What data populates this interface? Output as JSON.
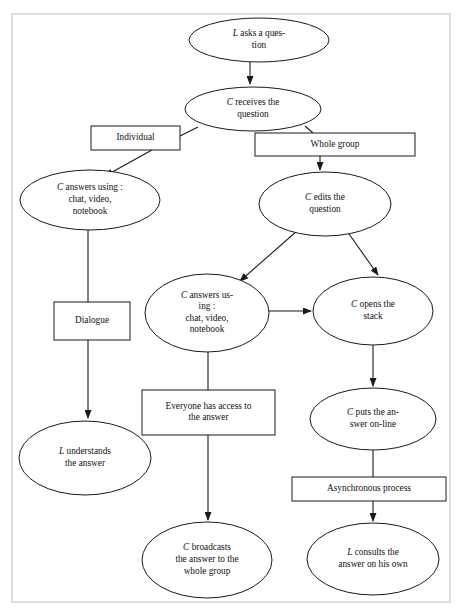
{
  "diagram": {
    "frame": {
      "x": 12,
      "y": 14,
      "width": 438,
      "height": 588,
      "color": "#c8c8c8"
    },
    "stroke_color": "#1a1a1a",
    "fill_color": "#ffffff",
    "nodes": [
      {
        "id": "l-asks-question",
        "shape": "ellipse",
        "cx": 259,
        "cy": 40,
        "rx": 70,
        "ry": 22,
        "lines": [
          "L asks a ques-",
          "tion"
        ],
        "actor": "L"
      },
      {
        "id": "c-receives-question",
        "shape": "ellipse",
        "cx": 253,
        "cy": 109,
        "rx": 68,
        "ry": 22,
        "lines": [
          "C  receives the",
          "question"
        ],
        "actor": "C"
      },
      {
        "id": "individual",
        "shape": "rect",
        "x": 91,
        "y": 126,
        "width": 89,
        "height": 24,
        "lines": [
          "Individual"
        ]
      },
      {
        "id": "whole-group",
        "shape": "rect",
        "x": 255,
        "y": 133,
        "width": 160,
        "height": 23,
        "lines": [
          "Whole group"
        ]
      },
      {
        "id": "c-answers-individual",
        "shape": "ellipse",
        "cx": 90,
        "cy": 200,
        "rx": 70,
        "ry": 30,
        "lines": [
          "C answers using :",
          "chat, video,",
          "notebook"
        ],
        "actor": "C"
      },
      {
        "id": "c-edits-question",
        "shape": "ellipse",
        "cx": 325,
        "cy": 204,
        "rx": 66,
        "ry": 32,
        "lines": [
          "C edits the",
          "question"
        ],
        "actor": "C"
      },
      {
        "id": "c-answers-group",
        "shape": "ellipse",
        "cx": 207,
        "cy": 313,
        "rx": 62,
        "ry": 39,
        "lines": [
          "C answers us-",
          "ing :",
          "chat, video,",
          "notebook"
        ],
        "actor": "C"
      },
      {
        "id": "c-opens-stack",
        "shape": "ellipse",
        "cx": 373,
        "cy": 311,
        "rx": 60,
        "ry": 34,
        "lines": [
          "C  opens the",
          "stack"
        ],
        "actor": "C"
      },
      {
        "id": "dialogue",
        "shape": "rect",
        "x": 54,
        "y": 302,
        "width": 76,
        "height": 38,
        "lines": [
          "Dialogue"
        ]
      },
      {
        "id": "everyone-access",
        "shape": "rect",
        "x": 142,
        "y": 390,
        "width": 133,
        "height": 45,
        "lines": [
          "Everyone has access to",
          "the answer"
        ]
      },
      {
        "id": "c-puts-answer-online",
        "shape": "ellipse",
        "cx": 373,
        "cy": 419,
        "rx": 63,
        "ry": 31,
        "lines": [
          "C  puts the an-",
          "swer on-line"
        ],
        "actor": "C"
      },
      {
        "id": "l-understands-answer",
        "shape": "ellipse",
        "cx": 85,
        "cy": 458,
        "rx": 66,
        "ry": 37,
        "lines": [
          "L understands",
          "the answer"
        ],
        "actor": "L"
      },
      {
        "id": "asynchronous-process",
        "shape": "rect",
        "x": 292,
        "y": 477,
        "width": 154,
        "height": 24,
        "lines": [
          "Asynchronous process"
        ]
      },
      {
        "id": "c-broadcasts",
        "shape": "ellipse",
        "cx": 207,
        "cy": 560,
        "rx": 65,
        "ry": 38,
        "lines": [
          "C  broadcasts",
          "the answer to the",
          "whole group"
        ],
        "actor": "C"
      },
      {
        "id": "l-consults-answer",
        "shape": "ellipse",
        "cx": 373,
        "cy": 559,
        "rx": 66,
        "ry": 36,
        "lines": [
          "L consults the",
          "answer on his own"
        ],
        "actor": "L"
      }
    ],
    "edges": [
      {
        "id": "e1",
        "from": "l-asks-question",
        "to": "c-receives-question",
        "path": "M 250 62 L 250 84",
        "arrow": true
      },
      {
        "id": "e2",
        "from": "c-receives-question",
        "to": "individual",
        "path": "M 198 127 L 180 136",
        "arrow": false
      },
      {
        "id": "e3",
        "from": "c-receives-question",
        "to": "whole-group",
        "path": "M 305 126 L 313 133",
        "arrow": false
      },
      {
        "id": "e4",
        "from": "individual",
        "to": "c-answers-individual",
        "path": "M 152 150 L 105 176",
        "arrow": true
      },
      {
        "id": "e5",
        "from": "whole-group",
        "to": "c-edits-question",
        "path": "M 320 156 L 320 170",
        "arrow": true
      },
      {
        "id": "e6",
        "from": "c-edits-question",
        "to": "c-answers-group",
        "path": "M 297 231 L 240 281",
        "arrow": true
      },
      {
        "id": "e7",
        "from": "c-edits-question",
        "to": "c-opens-stack",
        "path": "M 347 231 L 378 275",
        "arrow": true
      },
      {
        "id": "e8",
        "from": "c-answers-group",
        "to": "c-opens-stack",
        "path": "M 268 311 L 311 311",
        "arrow": true
      },
      {
        "id": "e9",
        "from": "c-answers-individual",
        "to": "dialogue",
        "path": "M 88 230 L 88 302",
        "arrow": false
      },
      {
        "id": "e10",
        "from": "dialogue",
        "to": "l-understands-answer",
        "path": "M 88 340 L 88 418",
        "arrow": true
      },
      {
        "id": "e11",
        "from": "c-answers-group",
        "to": "everyone-access",
        "path": "M 208 352 L 208 390",
        "arrow": false
      },
      {
        "id": "e12",
        "from": "c-opens-stack",
        "to": "c-puts-answer-online",
        "path": "M 373 345 L 373 386",
        "arrow": true
      },
      {
        "id": "e13",
        "from": "everyone-access",
        "to": "c-broadcasts",
        "path": "M 208 435 L 208 520",
        "arrow": true
      },
      {
        "id": "e14",
        "from": "c-puts-answer-online",
        "to": "asynchronous-process",
        "path": "M 373 450 L 373 477",
        "arrow": false
      },
      {
        "id": "e15",
        "from": "asynchronous-process",
        "to": "l-consults-answer",
        "path": "M 373 501 L 373 521",
        "arrow": true
      }
    ]
  }
}
